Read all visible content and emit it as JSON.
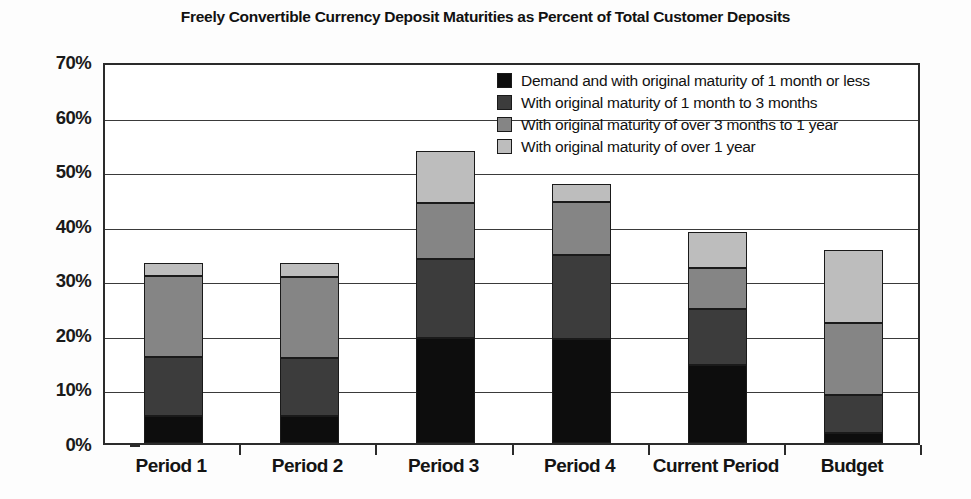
{
  "chart_data": {
    "type": "bar",
    "subtype": "stacked-column",
    "title": "Freely Convertible Currency Deposit Maturities as Percent of Total Customer Deposits",
    "xlabel": "",
    "ylabel": "",
    "ylim": [
      0,
      70
    ],
    "ytick_labels": [
      "0%",
      "10%",
      "20%",
      "30%",
      "40%",
      "50%",
      "60%",
      "70%"
    ],
    "ytick_values": [
      0,
      10,
      20,
      30,
      40,
      50,
      60,
      70
    ],
    "grid": true,
    "grid_axis": "y",
    "legend_position": "inside-top-center",
    "categories": [
      "Period 1",
      "Period 2",
      "Period 3",
      "Period 4",
      "Current Period",
      "Budget"
    ],
    "series": [
      {
        "name": "Demand and with original maturity of 1 month or less",
        "color": "#0d0d0d",
        "values": [
          5.0,
          5.0,
          19.2,
          19.0,
          14.3,
          1.8
        ]
      },
      {
        "name": "With original maturity of 1 month to 3 months",
        "color": "#3c3c3c",
        "values": [
          10.8,
          10.5,
          14.5,
          15.4,
          10.2,
          7.0
        ]
      },
      {
        "name": "With original maturity of over 3 months to 1 year",
        "color": "#858585",
        "values": [
          14.8,
          14.9,
          10.2,
          9.8,
          7.5,
          13.2
        ]
      },
      {
        "name": "With original maturity of over 1 year",
        "color": "#bdbdbd",
        "values": [
          2.4,
          2.6,
          9.6,
          3.2,
          6.6,
          13.3
        ]
      }
    ],
    "totals": [
      33.0,
      33.0,
      53.5,
      47.4,
      38.6,
      35.3
    ]
  }
}
